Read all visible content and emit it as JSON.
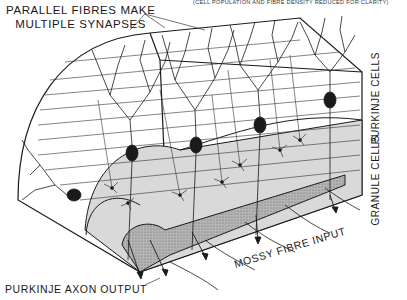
{
  "figure": {
    "title_line1": "PARALLEL FIBRES MAKE",
    "title_line2": "MULTIPLE SYNAPSES",
    "note": "(CELL POPULATION AND FIBRE DENSITY REDUCED FOR CLARITY)",
    "layer_labels": {
      "purkinje": "PURKINJE CELLS",
      "granule": "GRANULE CELLS"
    },
    "io_labels": {
      "output": "PURKINJE AXON OUTPUT",
      "input": "MOSSY FIBRE INPUT"
    },
    "colors": {
      "ink": "#1a1a1a",
      "granule_fill": "#d8d8d8",
      "white_matter_fill": "#a8a8a8",
      "background": "#ffffff"
    }
  }
}
